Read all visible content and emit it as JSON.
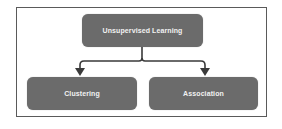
{
  "diagram": {
    "type": "tree",
    "root": {
      "label": "Unsupervised Learning"
    },
    "children": [
      {
        "label": "Clustering"
      },
      {
        "label": "Association"
      }
    ],
    "colors": {
      "node_fill": "#6b6b6b",
      "node_text": "#f2f2f2",
      "connector": "#3a3a3a",
      "frame_border": "#5a5a5a",
      "background": "#ffffff"
    }
  }
}
